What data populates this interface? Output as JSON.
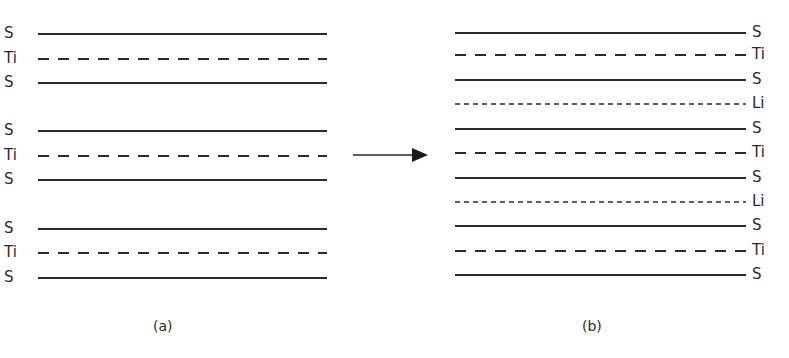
{
  "figure": {
    "arrow": {
      "from_x": 353,
      "to_x": 428,
      "y": 155
    },
    "panel_a": {
      "caption": "(a)",
      "caption_pos": [
        153,
        318
      ],
      "line_x1": 38,
      "line_x2": 327,
      "label_side": "left",
      "label_x": 4,
      "layers": [
        {
          "label": "S",
          "style": "solid",
          "y": 34
        },
        {
          "label": "Ti",
          "style": "dashed",
          "y": 59
        },
        {
          "label": "S",
          "style": "solid",
          "y": 83
        },
        {
          "label": "S",
          "style": "solid",
          "y": 131
        },
        {
          "label": "Ti",
          "style": "dashed",
          "y": 156
        },
        {
          "label": "S",
          "style": "solid",
          "y": 180
        },
        {
          "label": "S",
          "style": "solid",
          "y": 229
        },
        {
          "label": "Ti",
          "style": "dashed",
          "y": 253
        },
        {
          "label": "S",
          "style": "solid",
          "y": 278
        }
      ]
    },
    "panel_b": {
      "caption": "(b)",
      "caption_pos": [
        582,
        318
      ],
      "line_x1": 455,
      "line_x2": 746,
      "label_side": "right",
      "label_x": 752,
      "layers": [
        {
          "label": "S",
          "style": "solid",
          "y": 33
        },
        {
          "label": "Ti",
          "style": "dashed",
          "y": 55
        },
        {
          "label": "S",
          "style": "solid",
          "y": 80
        },
        {
          "label": "Li",
          "style": "dotted",
          "y": 104
        },
        {
          "label": "S",
          "style": "solid",
          "y": 129
        },
        {
          "label": "Ti",
          "style": "dashed",
          "y": 153
        },
        {
          "label": "S",
          "style": "solid",
          "y": 178
        },
        {
          "label": "Li",
          "style": "dotted",
          "y": 202
        },
        {
          "label": "S",
          "style": "solid",
          "y": 226
        },
        {
          "label": "Ti",
          "style": "dashed",
          "y": 251
        },
        {
          "label": "S",
          "style": "solid",
          "y": 275
        }
      ]
    }
  }
}
